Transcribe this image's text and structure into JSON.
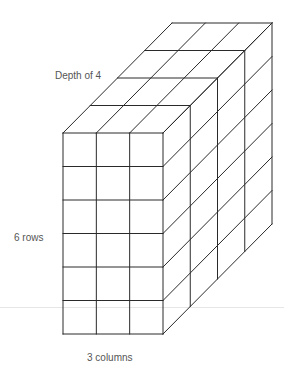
{
  "figure": {
    "type": "rectangular-prism-unit-cubes",
    "rows": 6,
    "columns": 3,
    "depth": 4,
    "stroke_color": "#2a2a2a",
    "label_color": "#555555",
    "front_face": {
      "left": 63,
      "top": 133,
      "right": 163,
      "bottom": 334
    },
    "depth_offset": {
      "dx": 27.25,
      "dy": -27.5
    }
  },
  "labels": {
    "depth": "Depth of 4",
    "rows": "6 rows",
    "columns": "3 columns"
  },
  "background_line_y": 307
}
